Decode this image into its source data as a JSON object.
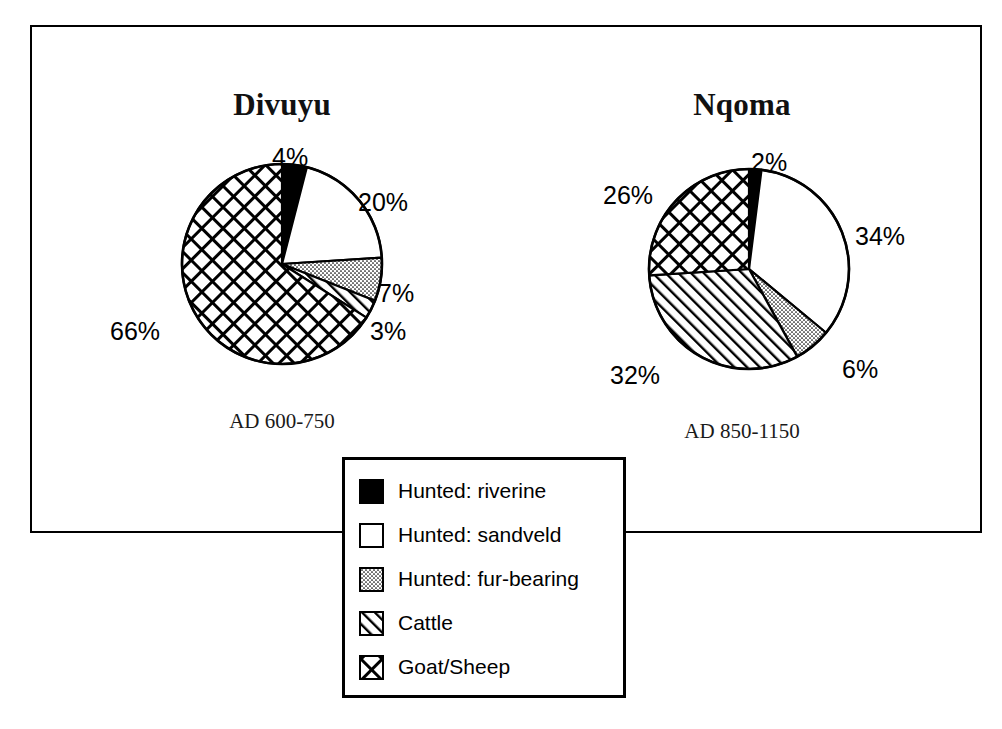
{
  "figure": {
    "background_color": "#ffffff",
    "line_color": "#000000"
  },
  "legend": {
    "name": "fauna-legend",
    "items": [
      {
        "key": "hunted_riverine",
        "label": "Hunted: riverine",
        "pattern": "solid-black",
        "swatch_icon": "black-square-icon"
      },
      {
        "key": "hunted_sandveld",
        "label": "Hunted: sandveld",
        "pattern": "white",
        "swatch_icon": "white-square-icon"
      },
      {
        "key": "hunted_fur_bearing",
        "label": "Hunted: fur-bearing",
        "pattern": "stipple",
        "swatch_icon": "dotted-square-icon"
      },
      {
        "key": "cattle",
        "label": "Cattle",
        "pattern": "hatch",
        "swatch_icon": "hatched-square-icon"
      },
      {
        "key": "goat_sheep",
        "label": "Goat/Sheep",
        "pattern": "crosshatch",
        "swatch_icon": "crosshatched-square-icon"
      }
    ]
  },
  "chart_data": [
    {
      "type": "pie",
      "id": "divuyu",
      "title": "Divuyu",
      "caption": "AD 600-750",
      "start_angle_deg": 0,
      "direction": "clockwise",
      "categories": [
        "Hunted: riverine",
        "Hunted: sandveld",
        "Hunted: fur-bearing",
        "Cattle",
        "Goat/Sheep"
      ],
      "values": [
        4,
        20,
        7,
        3,
        66
      ],
      "labels": [
        "4%",
        "20%",
        "7%",
        "3%",
        "66%"
      ],
      "patterns": [
        "solid-black",
        "white",
        "stipple",
        "hatch",
        "crosshatch"
      ],
      "label_positions": [
        {
          "label": "4%",
          "x": 272,
          "y": 145
        },
        {
          "label": "20%",
          "x": 358,
          "y": 190
        },
        {
          "label": "7%",
          "x": 378,
          "y": 281
        },
        {
          "label": "3%",
          "x": 370,
          "y": 319
        },
        {
          "label": "66%",
          "x": 110,
          "y": 319
        }
      ]
    },
    {
      "type": "pie",
      "id": "nqoma",
      "title": "Nqoma",
      "caption": "AD 850-1150",
      "start_angle_deg": 0,
      "direction": "clockwise",
      "categories": [
        "Hunted: riverine",
        "Hunted: sandveld",
        "Hunted: fur-bearing",
        "Cattle",
        "Goat/Sheep"
      ],
      "values": [
        2,
        34,
        6,
        32,
        26
      ],
      "labels": [
        "2%",
        "34%",
        "6%",
        "32%",
        "26%"
      ],
      "patterns": [
        "solid-black",
        "white",
        "stipple",
        "hatch",
        "crosshatch"
      ],
      "label_positions": [
        {
          "label": "2%",
          "x": 751,
          "y": 150
        },
        {
          "label": "34%",
          "x": 855,
          "y": 224
        },
        {
          "label": "6%",
          "x": 842,
          "y": 357
        },
        {
          "label": "32%",
          "x": 610,
          "y": 363
        },
        {
          "label": "26%",
          "x": 603,
          "y": 183
        }
      ]
    }
  ]
}
